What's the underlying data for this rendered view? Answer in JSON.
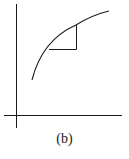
{
  "figure": {
    "caption": "(b)"
  },
  "colors": {
    "stroke": "#1a1a1a",
    "background": "#ffffff"
  }
}
